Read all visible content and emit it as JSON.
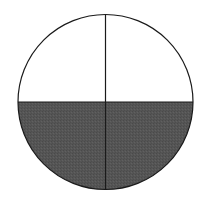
{
  "diagram": {
    "type": "fraction-circle",
    "parts_total": 4,
    "parts_shaded": 2,
    "shaded_region": "bottom-half",
    "colors": {
      "background": "#ffffff",
      "outline": "#1a1a1a",
      "shaded_fill": "#555555",
      "unshaded_fill": "#ffffff"
    },
    "circle": {
      "cx": 105.5,
      "cy": 102,
      "r": 87.5
    }
  }
}
